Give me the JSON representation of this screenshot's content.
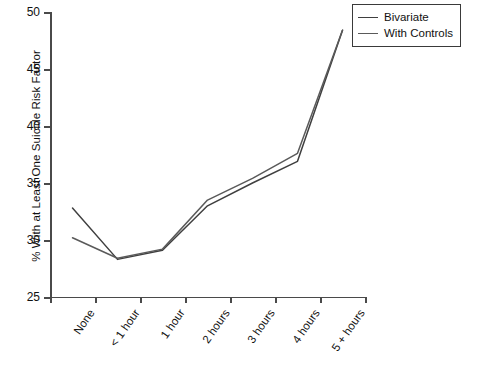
{
  "chart_data": {
    "type": "line",
    "title": "",
    "xlabel": "",
    "ylabel": "% With at Least One Suicide Risk Factor",
    "categories": [
      "None",
      "< 1 hour",
      "1 hour",
      "2 hours",
      "3 hours",
      "4 hours",
      "5 + hours"
    ],
    "series": [
      {
        "name": "Bivariate",
        "color": "#3f3f3f",
        "values": [
          32.8,
          28.3,
          29.1,
          33.0,
          35.0,
          36.9,
          48.4
        ]
      },
      {
        "name": "With Controls",
        "color": "#5a5a5a",
        "values": [
          30.2,
          28.4,
          29.2,
          33.5,
          35.4,
          37.6,
          48.4
        ]
      }
    ],
    "ylim": [
      25,
      50
    ],
    "yticks": [
      25,
      30,
      35,
      40,
      45,
      50
    ],
    "ytick_labels": [
      "25",
      "30",
      "35",
      "40",
      "45",
      "50"
    ],
    "grid": false,
    "legend_position": "top-right"
  },
  "legend": {
    "entries": [
      {
        "label": "Bivariate"
      },
      {
        "label": "With Controls"
      }
    ]
  }
}
